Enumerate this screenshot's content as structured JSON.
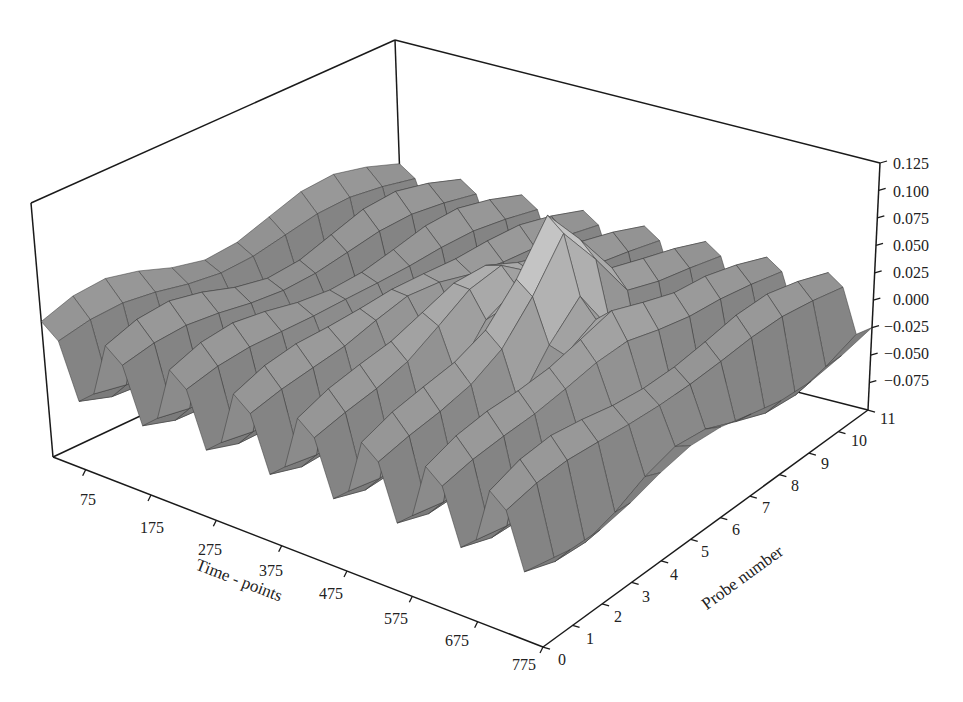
{
  "chart_data": {
    "type": "surface3d",
    "title": "",
    "xlabel": "Time - points",
    "ylabel": "Probe number",
    "zlabel": "",
    "x_ticks": [
      75,
      175,
      275,
      375,
      475,
      575,
      675,
      775
    ],
    "y_ticks": [
      0,
      1,
      2,
      3,
      4,
      5,
      6,
      7,
      8,
      9,
      10,
      11
    ],
    "z_ticks": [
      "0.125",
      "0.100",
      "0.075",
      "0.050",
      "0.025",
      "0.000",
      "−0.025",
      "−0.050",
      "−0.075"
    ],
    "xlim": [
      25,
      775
    ],
    "ylim": [
      0,
      11
    ],
    "zlim": [
      -0.1,
      0.125
    ],
    "grid": false,
    "colormap": "grayscale (lighter = higher)",
    "peak": {
      "time": 525,
      "probe": 6,
      "value": 0.12
    },
    "approx_range": {
      "min": -0.09,
      "max": 0.12
    }
  },
  "labels": {
    "x_title": "Time - points",
    "y_title": "Probe number"
  },
  "axes": {
    "x_tick_labels": [
      "75",
      "175",
      "275",
      "375",
      "475",
      "575",
      "675",
      "775"
    ],
    "y_tick_labels": [
      "0",
      "1",
      "2",
      "3",
      "4",
      "5",
      "6",
      "7",
      "8",
      "9",
      "10",
      "11"
    ],
    "z_tick_labels": [
      "0.125",
      "0.100",
      "0.075",
      "0.050",
      "0.025",
      "0.000",
      "−0.025",
      "−0.050",
      "−0.075"
    ]
  }
}
